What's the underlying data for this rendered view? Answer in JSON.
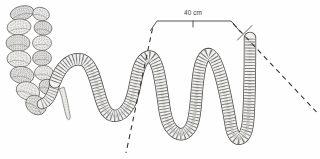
{
  "figure": {
    "name": "intestine-anatomical-drawing",
    "width": 320,
    "height": 159,
    "background_color": "#fefefe",
    "ink_color": "#4a4a4a",
    "tissue_fill": "#f0efec",
    "striation_color": "#848484"
  },
  "annotations": {
    "scale": {
      "label": "40 cm",
      "label_x": 193,
      "label_y": 14.5,
      "bracket_path": "M150.5,30.5 L157,21 L231,21 L240.5,32",
      "center_tick_path": "M193,21 L193,27",
      "cross_tick_path": "M252,25.5 L237.5,40"
    },
    "leaders": [
      {
        "name": "left-dashed-leader",
        "path": "M152.5,28.5 L126,153",
        "dash": "5 4"
      },
      {
        "name": "right-dashed-leader",
        "path": "M233,23.5 L316.5,112",
        "dash": "5 4"
      }
    ]
  },
  "illustration": {
    "intestine_path": "M55,82 C60,68 70,56 83,60 C94,64 97,90 103,105 C109,120 121,119 129,105 C137,91 135,62 147,57 C159,52 161,88 165,112 C169,134 183,141 191,127 C199,113 194,64 206,55 C217,47 226,96 231,126 C234,144 246,143 248,122 C250,101 250,58 250,38",
    "connector_path": "M42,104 C49,102 53,93 55,83",
    "appendix_path": "M59,89 C63,99 64,111 67,118 C68,121 71,120 70,115 C68,105 67,96 64,87 Z",
    "colon_pouches": [
      {
        "cx": 22,
        "cy": 13,
        "rx": 12,
        "ry": 7,
        "rot": -13
      },
      {
        "cx": 19,
        "cy": 27,
        "rx": 12,
        "ry": 8,
        "rot": -6
      },
      {
        "cx": 18,
        "cy": 43,
        "rx": 12,
        "ry": 8.5,
        "rot": 0
      },
      {
        "cx": 19,
        "cy": 59,
        "rx": 12,
        "ry": 8.5,
        "rot": 4
      },
      {
        "cx": 22,
        "cy": 75,
        "rx": 12,
        "ry": 8.5,
        "rot": 9
      },
      {
        "cx": 28,
        "cy": 91,
        "rx": 12,
        "ry": 9,
        "rot": 20
      },
      {
        "cx": 36,
        "cy": 105,
        "rx": 11,
        "ry": 9,
        "rot": 38
      },
      {
        "cx": 41,
        "cy": 14,
        "rx": 8.5,
        "ry": 6.5,
        "rot": 16
      },
      {
        "cx": 43,
        "cy": 28,
        "rx": 9,
        "ry": 7,
        "rot": 6
      },
      {
        "cx": 42,
        "cy": 43,
        "rx": 9.5,
        "ry": 7.5,
        "rot": 0
      },
      {
        "cx": 42,
        "cy": 58,
        "rx": 9.5,
        "ry": 7.5,
        "rot": 0
      },
      {
        "cx": 44,
        "cy": 73,
        "rx": 9.5,
        "ry": 7.5,
        "rot": 7
      },
      {
        "cx": 48,
        "cy": 87,
        "rx": 9,
        "ry": 7.5,
        "rot": 22
      }
    ]
  }
}
